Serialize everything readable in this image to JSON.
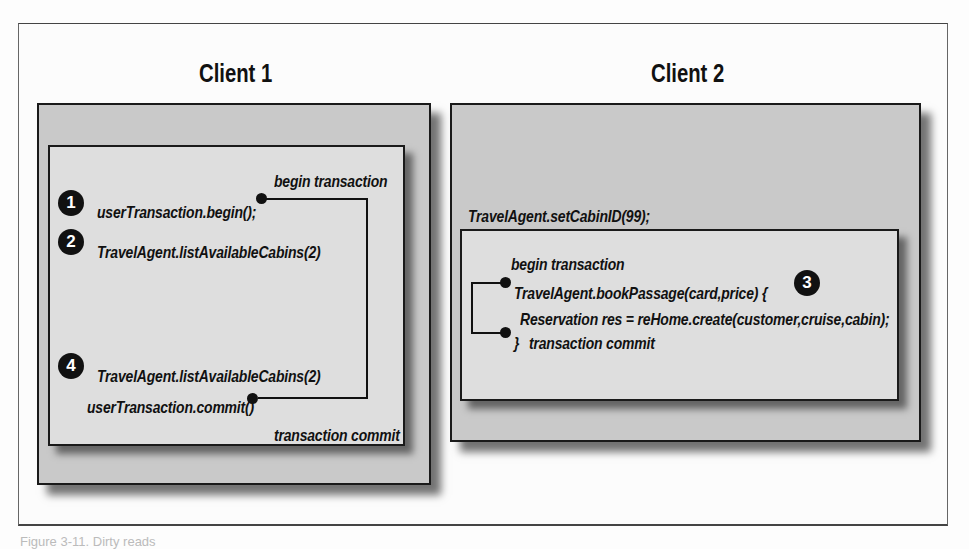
{
  "clients": [
    {
      "title": "Client 1",
      "begin_label": "begin transaction",
      "commit_label": "transaction commit",
      "steps": [
        {
          "badge": "1",
          "code": "userTransaction.begin();"
        },
        {
          "badge": "2",
          "code": "TravelAgent.listAvailableCabins(2)"
        },
        {
          "badge": "4",
          "code": "TravelAgent.listAvailableCabins(2)"
        }
      ],
      "commit_code": "userTransaction.commit()"
    },
    {
      "title": "Client 2",
      "outer_code": "TravelAgent.setCabinID(99);",
      "begin_label": "begin transaction",
      "steps": [
        {
          "badge": "3",
          "code": "TravelAgent.bookPassage(card,price) {"
        }
      ],
      "body_code": "Reservation res = reHome.create(customer,cruise,cabin);",
      "close_code": "}",
      "commit_label": "transaction commit"
    }
  ],
  "caption": "Figure 3-11. Dirty reads"
}
